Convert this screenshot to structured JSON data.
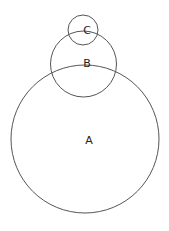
{
  "diagram": {
    "type": "circle-diagram",
    "stroke_color": "#555555",
    "circles": [
      {
        "id": "A",
        "label": "A",
        "cx": 85,
        "cy": 139,
        "r": 74,
        "label_x": 89,
        "label_y": 140
      },
      {
        "id": "B",
        "label": "B",
        "cx": 83.5,
        "cy": 64,
        "r": 33,
        "label_x": 87,
        "label_y": 63
      },
      {
        "id": "C",
        "label": "C",
        "cx": 83,
        "cy": 30,
        "r": 15,
        "label_x": 87,
        "label_y": 30
      }
    ]
  }
}
